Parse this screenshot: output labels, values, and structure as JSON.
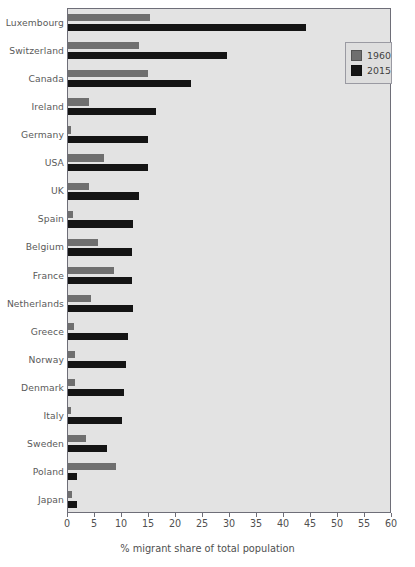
{
  "chart_data": {
    "type": "bar",
    "orientation": "horizontal",
    "title": "",
    "xlabel": "% migrant share of total population",
    "ylabel": "",
    "xlim": [
      0,
      60
    ],
    "xticks": [
      0,
      5,
      10,
      15,
      20,
      25,
      30,
      35,
      40,
      45,
      50,
      55,
      60
    ],
    "grid": false,
    "legend_position": "top-right",
    "categories": [
      "Luxembourg",
      "Switzerland",
      "Canada",
      "Ireland",
      "Germany",
      "USA",
      "UK",
      "Spain",
      "Belgium",
      "France",
      "Netherlands",
      "Greece",
      "Norway",
      "Denmark",
      "Italy",
      "Sweden",
      "Poland",
      "Japan"
    ],
    "series": [
      {
        "name": "1960",
        "color": "#6f6f6f",
        "values": [
          15.2,
          13.1,
          14.8,
          3.9,
          0.5,
          6.7,
          3.9,
          0.9,
          5.6,
          8.5,
          4.3,
          1.1,
          1.3,
          1.3,
          0.5,
          3.4,
          8.9,
          0.7
        ]
      },
      {
        "name": "2015",
        "color": "#141414",
        "values": [
          44.0,
          29.4,
          22.8,
          16.3,
          14.8,
          14.8,
          13.1,
          12.0,
          11.9,
          11.9,
          12.0,
          11.1,
          10.7,
          10.4,
          10.0,
          7.3,
          1.6,
          1.7
        ]
      }
    ]
  },
  "legend": {
    "items": [
      {
        "label": "1960",
        "color": "#6f6f6f"
      },
      {
        "label": "2015",
        "color": "#141414"
      }
    ]
  }
}
